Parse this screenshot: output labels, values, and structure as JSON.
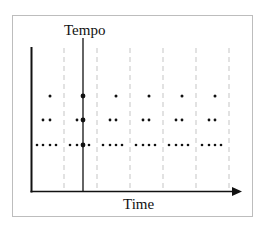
{
  "diagram": {
    "title": "Tempo",
    "x_axis_label": "Time",
    "beat_segments": 7,
    "levels": [
      {
        "name": "level-1",
        "dots_per_beat": 1
      },
      {
        "name": "level-2",
        "dots_per_beat": 2
      },
      {
        "name": "level-3",
        "dots_per_beat": 4
      }
    ],
    "tempo_marker_beat_index": 1,
    "colors": {
      "axis": "#111111",
      "grid_dashed": "#cccccc",
      "frame": "#bdbdbd",
      "dot": "#111111"
    }
  }
}
